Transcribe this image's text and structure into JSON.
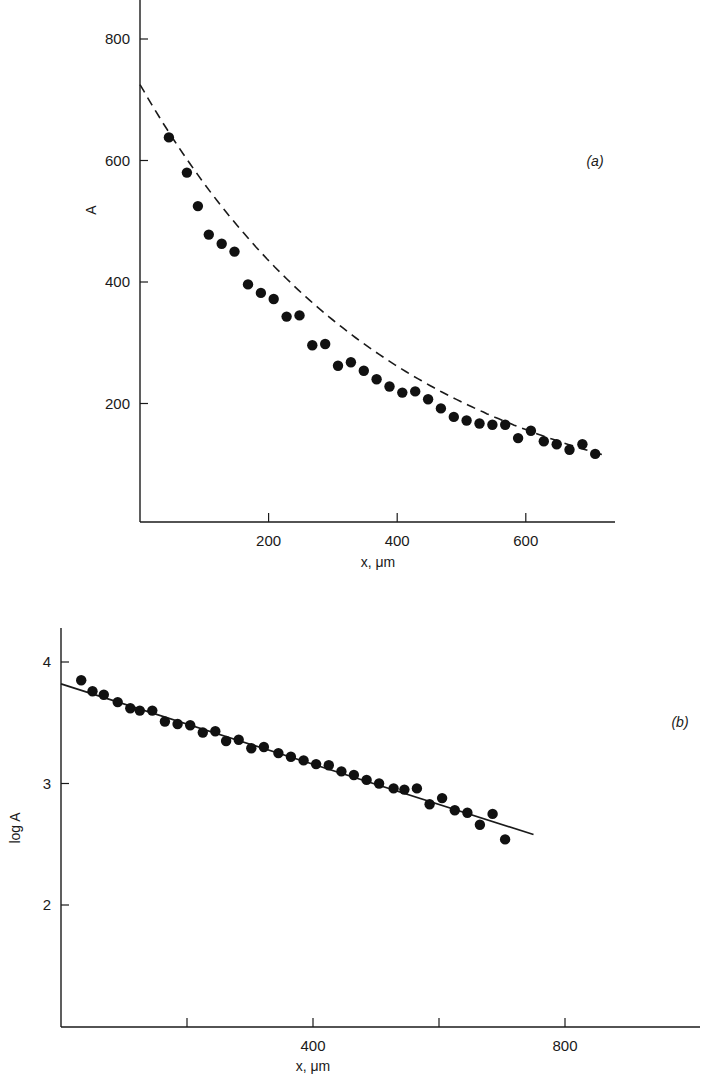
{
  "chart_data": [
    {
      "id": "a",
      "type": "scatter",
      "panel_label": "(a)",
      "title": "",
      "xlabel": "x, μm",
      "ylabel": "A",
      "xlim": [
        0,
        720
      ],
      "ylim": [
        0,
        850
      ],
      "xticks": [
        200,
        400,
        600
      ],
      "yticks": [
        200,
        400,
        600,
        800
      ],
      "xtick_labels": [
        "200",
        "400",
        "600"
      ],
      "ytick_labels": [
        "200",
        "400",
        "600",
        "800"
      ],
      "grid": false,
      "legend": null,
      "fit": {
        "style": "dashed",
        "kind": "exponential",
        "A0": 725,
        "k": 0.00255,
        "x_range": [
          0,
          720
        ]
      },
      "x": [
        45,
        73,
        90,
        107,
        127,
        147,
        168,
        188,
        208,
        228,
        248,
        268,
        288,
        308,
        328,
        348,
        368,
        388,
        408,
        428,
        448,
        468,
        488,
        508,
        528,
        548,
        568,
        588,
        608,
        628,
        648,
        668,
        688,
        708
      ],
      "values": [
        638,
        580,
        525,
        478,
        463,
        450,
        396,
        382,
        372,
        343,
        345,
        296,
        298,
        262,
        268,
        254,
        240,
        228,
        218,
        220,
        207,
        192,
        178,
        172,
        167,
        165,
        165,
        143,
        155,
        138,
        133,
        124,
        133,
        117
      ]
    },
    {
      "id": "b",
      "type": "scatter",
      "panel_label": "(b)",
      "title": "",
      "xlabel": "x, μm",
      "ylabel": "log A",
      "xlim": [
        0,
        1000
      ],
      "ylim": [
        1,
        4.3
      ],
      "xticks": [
        200,
        400,
        600,
        800
      ],
      "yticks": [
        2,
        3,
        4
      ],
      "xtick_labels": [
        "",
        "400",
        "",
        "800"
      ],
      "ytick_labels": [
        "2",
        "3",
        "4"
      ],
      "grid": false,
      "legend": null,
      "fit": {
        "style": "solid",
        "kind": "linear",
        "x_range": [
          0,
          750
        ],
        "y_range": [
          3.82,
          2.58
        ]
      },
      "x": [
        32,
        50,
        68,
        90,
        110,
        125,
        145,
        165,
        185,
        205,
        225,
        245,
        262,
        282,
        302,
        322,
        345,
        365,
        385,
        405,
        425,
        445,
        465,
        485,
        505,
        528,
        545,
        565,
        585,
        605,
        625,
        645,
        665,
        685,
        705
      ],
      "values": [
        3.85,
        3.76,
        3.73,
        3.67,
        3.62,
        3.6,
        3.6,
        3.51,
        3.49,
        3.48,
        3.42,
        3.43,
        3.35,
        3.36,
        3.29,
        3.3,
        3.25,
        3.22,
        3.19,
        3.16,
        3.15,
        3.1,
        3.07,
        3.03,
        3.0,
        2.96,
        2.95,
        2.96,
        2.83,
        2.88,
        2.78,
        2.76,
        2.66,
        2.75,
        2.54
      ]
    }
  ]
}
